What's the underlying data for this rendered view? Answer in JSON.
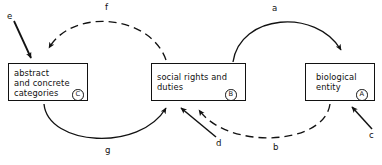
{
  "diagram": {
    "type": "node-arc-diagram",
    "background_color": "#ffffff",
    "line_color": "#121212",
    "nodes": [
      {
        "id": "C",
        "name": "abstract-and-concrete-categories",
        "text": "abstract\nand concrete\ncategories",
        "tag": "C",
        "x": 8,
        "y": 63,
        "width": 80,
        "height": 38
      },
      {
        "id": "B",
        "name": "social-rights-and-duties",
        "text": "social rights and\nduties",
        "tag": "B",
        "x": 151,
        "y": 63,
        "width": 95,
        "height": 38
      },
      {
        "id": "A",
        "name": "biological-entity",
        "text": "biological\nentity",
        "tag": "A",
        "x": 305,
        "y": 63,
        "width": 70,
        "height": 38
      }
    ],
    "edges": [
      {
        "label": "a",
        "style": "solid",
        "from": "B",
        "to": "A",
        "position": "above",
        "description": "solid arc from social rights and duties over to biological entity"
      },
      {
        "label": "b",
        "style": "dashed",
        "from": "A",
        "to": "B",
        "position": "below",
        "description": "dashed arc from biological entity under to social rights and duties"
      },
      {
        "label": "c",
        "style": "solid",
        "from": "external",
        "to": "A",
        "position": "below-right",
        "description": "solid straight arrow entering biological entity from lower right"
      },
      {
        "label": "d",
        "style": "solid",
        "from": "external",
        "to": "B",
        "position": "below",
        "description": "solid straight arrow entering social rights and duties from lower right"
      },
      {
        "label": "e",
        "style": "solid",
        "from": "external",
        "to": "C",
        "position": "above-left",
        "description": "solid straight arrow entering abstract and concrete categories from upper left"
      },
      {
        "label": "f",
        "style": "dashed",
        "from": "B",
        "to": "C",
        "position": "above",
        "description": "dashed arc from social rights and duties over to abstract and concrete categories"
      },
      {
        "label": "g",
        "style": "solid",
        "from": "C",
        "to": "B",
        "position": "below",
        "description": "solid arc from abstract and concrete categories under to social rights and duties"
      }
    ],
    "labels": {
      "a": "a",
      "b": "b",
      "c": "c",
      "d": "d",
      "e": "e",
      "f": "f",
      "g": "g"
    }
  }
}
